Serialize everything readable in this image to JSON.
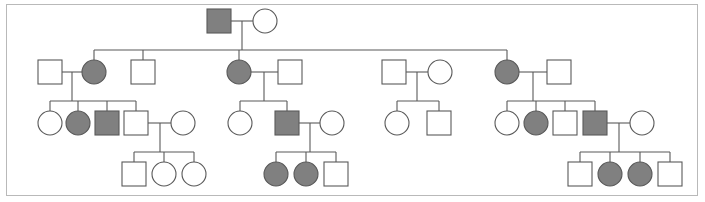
{
  "figure": {
    "kind": "pedigree-chart",
    "title": "",
    "frame": {
      "x": 6,
      "y": 4,
      "width": 692,
      "height": 192,
      "border_color": "#b9b9b9"
    },
    "background_color": "#ffffff"
  },
  "legend": {
    "affected_fill": "#808080",
    "unaffected_fill": "#ffffff",
    "symbol_stroke_male": "#595959",
    "symbol_stroke_female": "#595959",
    "line_color": "#595959",
    "male_symbol": "square",
    "female_symbol": "circle",
    "affected_meaning": "affected",
    "unaffected_meaning": "unaffected"
  },
  "chart_data": {
    "type": "diagram",
    "diagram_type": "pedigree",
    "generations": 4,
    "symbol_size": 24,
    "individuals": [
      {
        "id": "I-1",
        "generation": 1,
        "sex": "male",
        "affected": true,
        "cx": 219,
        "cy": 21,
        "shape": "square"
      },
      {
        "id": "I-2",
        "generation": 1,
        "sex": "female",
        "affected": false,
        "cx": 265,
        "cy": 21,
        "shape": "circle"
      },
      {
        "id": "II-1",
        "generation": 2,
        "sex": "male",
        "affected": false,
        "cx": 50,
        "cy": 72,
        "shape": "square"
      },
      {
        "id": "II-2",
        "generation": 2,
        "sex": "female",
        "affected": true,
        "cx": 94,
        "cy": 72,
        "shape": "circle"
      },
      {
        "id": "II-3",
        "generation": 2,
        "sex": "male",
        "affected": false,
        "cx": 143,
        "cy": 72,
        "shape": "square"
      },
      {
        "id": "II-4",
        "generation": 2,
        "sex": "female",
        "affected": true,
        "cx": 239,
        "cy": 72,
        "shape": "circle"
      },
      {
        "id": "II-5",
        "generation": 2,
        "sex": "male",
        "affected": false,
        "cx": 290,
        "cy": 72,
        "shape": "square"
      },
      {
        "id": "II-6",
        "generation": 2,
        "sex": "male",
        "affected": false,
        "cx": 394,
        "cy": 72,
        "shape": "square"
      },
      {
        "id": "II-7",
        "generation": 2,
        "sex": "female",
        "affected": false,
        "cx": 440,
        "cy": 72,
        "shape": "circle"
      },
      {
        "id": "II-8",
        "generation": 2,
        "sex": "female",
        "affected": true,
        "cx": 507,
        "cy": 72,
        "shape": "circle"
      },
      {
        "id": "II-9",
        "generation": 2,
        "sex": "male",
        "affected": false,
        "cx": 559,
        "cy": 72,
        "shape": "square"
      },
      {
        "id": "III-1",
        "generation": 3,
        "sex": "female",
        "affected": false,
        "cx": 50,
        "cy": 123,
        "shape": "circle"
      },
      {
        "id": "III-2",
        "generation": 3,
        "sex": "female",
        "affected": true,
        "cx": 78,
        "cy": 123,
        "shape": "circle"
      },
      {
        "id": "III-3",
        "generation": 3,
        "sex": "male",
        "affected": true,
        "cx": 107,
        "cy": 123,
        "shape": "square"
      },
      {
        "id": "III-4",
        "generation": 3,
        "sex": "male",
        "affected": false,
        "cx": 136,
        "cy": 123,
        "shape": "square"
      },
      {
        "id": "III-5",
        "generation": 3,
        "sex": "female",
        "affected": false,
        "cx": 183,
        "cy": 123,
        "shape": "circle"
      },
      {
        "id": "III-6",
        "generation": 3,
        "sex": "female",
        "affected": false,
        "cx": 240,
        "cy": 123,
        "shape": "circle"
      },
      {
        "id": "III-7",
        "generation": 3,
        "sex": "male",
        "affected": true,
        "cx": 287,
        "cy": 123,
        "shape": "square"
      },
      {
        "id": "III-8",
        "generation": 3,
        "sex": "female",
        "affected": false,
        "cx": 332,
        "cy": 123,
        "shape": "circle"
      },
      {
        "id": "III-9",
        "generation": 3,
        "sex": "female",
        "affected": false,
        "cx": 397,
        "cy": 123,
        "shape": "circle"
      },
      {
        "id": "III-10",
        "generation": 3,
        "sex": "male",
        "affected": false,
        "cx": 439,
        "cy": 123,
        "shape": "square"
      },
      {
        "id": "III-11",
        "generation": 3,
        "sex": "female",
        "affected": false,
        "cx": 507,
        "cy": 123,
        "shape": "circle"
      },
      {
        "id": "III-12",
        "generation": 3,
        "sex": "female",
        "affected": true,
        "cx": 536,
        "cy": 123,
        "shape": "circle"
      },
      {
        "id": "III-13",
        "generation": 3,
        "sex": "male",
        "affected": false,
        "cx": 565,
        "cy": 123,
        "shape": "square"
      },
      {
        "id": "III-14",
        "generation": 3,
        "sex": "male",
        "affected": true,
        "cx": 595,
        "cy": 123,
        "shape": "square"
      },
      {
        "id": "III-15",
        "generation": 3,
        "sex": "female",
        "affected": false,
        "cx": 642,
        "cy": 123,
        "shape": "circle"
      },
      {
        "id": "IV-1",
        "generation": 4,
        "sex": "male",
        "affected": false,
        "cx": 134,
        "cy": 174,
        "shape": "square"
      },
      {
        "id": "IV-2",
        "generation": 4,
        "sex": "female",
        "affected": false,
        "cx": 164,
        "cy": 174,
        "shape": "circle"
      },
      {
        "id": "IV-3",
        "generation": 4,
        "sex": "female",
        "affected": false,
        "cx": 194,
        "cy": 174,
        "shape": "circle"
      },
      {
        "id": "IV-4",
        "generation": 4,
        "sex": "female",
        "affected": true,
        "cx": 276,
        "cy": 174,
        "shape": "circle"
      },
      {
        "id": "IV-5",
        "generation": 4,
        "sex": "female",
        "affected": true,
        "cx": 306,
        "cy": 174,
        "shape": "circle"
      },
      {
        "id": "IV-6",
        "generation": 4,
        "sex": "male",
        "affected": false,
        "cx": 336,
        "cy": 174,
        "shape": "square"
      },
      {
        "id": "IV-7",
        "generation": 4,
        "sex": "male",
        "affected": false,
        "cx": 580,
        "cy": 174,
        "shape": "square"
      },
      {
        "id": "IV-8",
        "generation": 4,
        "sex": "female",
        "affected": true,
        "cx": 610,
        "cy": 174,
        "shape": "circle"
      },
      {
        "id": "IV-9",
        "generation": 4,
        "sex": "female",
        "affected": true,
        "cx": 640,
        "cy": 174,
        "shape": "circle"
      },
      {
        "id": "IV-10",
        "generation": 4,
        "sex": "male",
        "affected": false,
        "cx": 670,
        "cy": 174,
        "shape": "square"
      }
    ],
    "matings": [
      {
        "id": "M1",
        "partners": [
          "I-1",
          "I-2"
        ],
        "mate_y": 21,
        "drop_x": 242,
        "sib_y": 50,
        "children": [
          "II-2",
          "II-3",
          "II-4",
          "II-8"
        ],
        "sib_span": [
          94,
          507
        ]
      },
      {
        "id": "M2",
        "partners": [
          "II-1",
          "II-2"
        ],
        "mate_y": 72,
        "drop_x": 72,
        "sib_y": 101,
        "children": [
          "III-1",
          "III-2",
          "III-3",
          "III-4"
        ],
        "sib_span": [
          50,
          136
        ]
      },
      {
        "id": "M3",
        "partners": [
          "II-4",
          "II-5"
        ],
        "mate_y": 72,
        "drop_x": 264,
        "sib_y": 101,
        "children": [
          "III-6",
          "III-7"
        ],
        "sib_span": [
          240,
          287
        ]
      },
      {
        "id": "M4",
        "partners": [
          "II-6",
          "II-7"
        ],
        "mate_y": 72,
        "drop_x": 417,
        "sib_y": 101,
        "children": [
          "III-9",
          "III-10"
        ],
        "sib_span": [
          397,
          439
        ]
      },
      {
        "id": "M5",
        "partners": [
          "II-8",
          "II-9"
        ],
        "mate_y": 72,
        "drop_x": 533,
        "sib_y": 101,
        "children": [
          "III-11",
          "III-12",
          "III-13",
          "III-14"
        ],
        "sib_span": [
          507,
          595
        ]
      },
      {
        "id": "M6",
        "partners": [
          "III-4",
          "III-5"
        ],
        "mate_y": 123,
        "drop_x": 160,
        "sib_y": 152,
        "children": [
          "IV-1",
          "IV-2",
          "IV-3"
        ],
        "sib_span": [
          134,
          194
        ]
      },
      {
        "id": "M7",
        "partners": [
          "III-7",
          "III-8"
        ],
        "mate_y": 123,
        "drop_x": 310,
        "sib_y": 152,
        "children": [
          "IV-4",
          "IV-5",
          "IV-6"
        ],
        "sib_span": [
          276,
          336
        ]
      },
      {
        "id": "M8",
        "partners": [
          "III-14",
          "III-15"
        ],
        "mate_y": 123,
        "drop_x": 619,
        "sib_y": 152,
        "children": [
          "IV-7",
          "IV-8",
          "IV-9",
          "IV-10"
        ],
        "sib_span": [
          580,
          670
        ]
      }
    ],
    "counts": {
      "total_individuals": 36,
      "affected_individuals": 12,
      "unaffected_individuals": 24,
      "affected_males": 4,
      "affected_females": 8
    }
  }
}
